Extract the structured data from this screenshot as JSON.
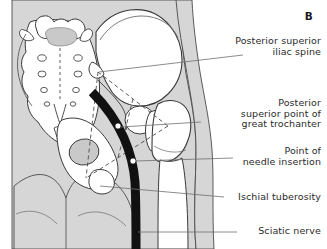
{
  "figure": {
    "panel_label": "B",
    "view": "posterior"
  },
  "colors": {
    "soft_tissue": "#d6d6d6",
    "bone_fill": "#ffffff",
    "cartilage_fill": "#c9c9c9",
    "nerve": "#111111",
    "outline": "#3a3a3a",
    "leader_line": "#6e6e6e",
    "dashed_line": "#4a4a4a",
    "text": "#2b2b2b",
    "background": "#ffffff"
  },
  "labels": [
    {
      "id": "psis",
      "name": "posterior-superior-iliac-spine",
      "lines": [
        "Posterior superior",
        "iliac spine"
      ],
      "line1": "Posterior superior",
      "line2": "iliac spine"
    },
    {
      "id": "great-trochanter",
      "name": "posterior-superior-point-of-great-trochanter",
      "lines": [
        "Posterior",
        "superior point of",
        "great trochanter"
      ],
      "line1": "Posterior",
      "line2": "superior point of",
      "line3": "great trochanter"
    },
    {
      "id": "needle",
      "name": "point-of-needle-insertion",
      "lines": [
        "Point of",
        "needle insertion"
      ],
      "line1": "Point of",
      "line2": "needle insertion"
    },
    {
      "id": "ischial-tuberosity",
      "name": "ischial-tuberosity",
      "lines": [
        "Ischial tuberosity"
      ],
      "line1": "Ischial tuberosity"
    },
    {
      "id": "sciatic-nerve",
      "name": "sciatic-nerve",
      "lines": [
        "Sciatic nerve"
      ],
      "line1": "Sciatic nerve"
    }
  ],
  "markers": [
    {
      "id": "marker-great-trochanter",
      "name": "landmark-dot-great-trochanter"
    },
    {
      "id": "marker-needle-insertion",
      "name": "landmark-dot-needle-insertion"
    }
  ],
  "structures": [
    {
      "name": "sacrum"
    },
    {
      "name": "lumbar-vertebra"
    },
    {
      "name": "sacral-foramina"
    },
    {
      "name": "ilium"
    },
    {
      "name": "iliac-crest"
    },
    {
      "name": "femoral-head"
    },
    {
      "name": "greater-trochanter"
    },
    {
      "name": "femur-shaft"
    },
    {
      "name": "ischium"
    },
    {
      "name": "coccyx"
    },
    {
      "name": "gluteal-cleft"
    },
    {
      "name": "sciatic-nerve-band"
    }
  ]
}
